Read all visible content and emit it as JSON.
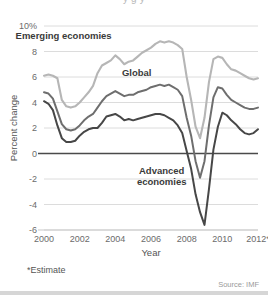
{
  "figure": {
    "title_partial": "y   g   y",
    "footnote": "*Estimate",
    "source": "Source: IMF"
  },
  "colors": {
    "emerging": "#b6b6b6",
    "global": "#6e6e6e",
    "advanced": "#474747",
    "grid": "#dcdcdc",
    "zero_line": "#4a4a4a",
    "text": "#555555"
  },
  "chart_data": {
    "type": "line",
    "title": "",
    "xlabel": "Year",
    "ylabel": "Percent change",
    "xlim": [
      2000,
      2012
    ],
    "ylim": [
      -6,
      10
    ],
    "ytick_labels": [
      "10%",
      "8",
      "6",
      "4",
      "2",
      "0",
      "-2",
      "-4",
      "-6"
    ],
    "yticks": [
      10,
      8,
      6,
      4,
      2,
      0,
      -2,
      -4,
      -6
    ],
    "xtick_labels": [
      "2000",
      "2002",
      "2004",
      "2006",
      "2008",
      "2010",
      "2012*"
    ],
    "xticks": [
      2000,
      2002,
      2004,
      2006,
      2008,
      2010,
      2012
    ],
    "grid": true,
    "legend_position": "inline-annotations",
    "x": [
      2000,
      2000.25,
      2000.5,
      2000.75,
      2001,
      2001.25,
      2001.5,
      2001.75,
      2002,
      2002.25,
      2002.5,
      2002.75,
      2003,
      2003.25,
      2003.5,
      2003.75,
      2004,
      2004.25,
      2004.5,
      2004.75,
      2005,
      2005.25,
      2005.5,
      2005.75,
      2006,
      2006.25,
      2006.5,
      2006.75,
      2007,
      2007.25,
      2007.5,
      2007.75,
      2008,
      2008.25,
      2008.5,
      2008.75,
      2009,
      2009.25,
      2009.5,
      2009.75,
      2010,
      2010.25,
      2010.5,
      2010.75,
      2011,
      2011.25,
      2011.5,
      2011.75,
      2012
    ],
    "series": [
      {
        "name": "Emerging economies",
        "color": "#b6b6b6",
        "values": [
          6.1,
          6.2,
          6.1,
          5.9,
          4.2,
          3.7,
          3.6,
          3.7,
          4.0,
          4.4,
          4.8,
          5.3,
          6.3,
          6.9,
          7.1,
          7.3,
          7.7,
          7.4,
          7.0,
          7.2,
          7.3,
          7.6,
          7.9,
          8.1,
          8.3,
          8.6,
          8.8,
          8.7,
          8.8,
          8.7,
          8.5,
          8.2,
          6.0,
          4.2,
          2.1,
          1.2,
          2.8,
          5.6,
          7.4,
          7.6,
          7.5,
          7.0,
          6.6,
          6.5,
          6.3,
          6.1,
          5.9,
          5.8,
          5.9
        ]
      },
      {
        "name": "Global",
        "color": "#6e6e6e",
        "values": [
          4.8,
          4.7,
          4.3,
          3.3,
          2.3,
          1.9,
          1.8,
          1.9,
          2.2,
          2.6,
          2.9,
          3.1,
          3.6,
          4.1,
          4.5,
          4.7,
          4.9,
          4.7,
          4.5,
          4.6,
          4.6,
          4.8,
          4.9,
          5.0,
          5.2,
          5.3,
          5.4,
          5.3,
          5.4,
          5.2,
          5.0,
          4.5,
          2.8,
          1.4,
          -0.6,
          -1.9,
          -0.6,
          2.2,
          4.4,
          5.2,
          5.1,
          4.6,
          4.2,
          4.0,
          3.8,
          3.6,
          3.5,
          3.5,
          3.6
        ]
      },
      {
        "name": "Advanced economies",
        "color": "#474747",
        "values": [
          4.1,
          3.9,
          3.4,
          2.2,
          1.2,
          0.9,
          0.9,
          1.0,
          1.4,
          1.7,
          1.9,
          2.0,
          2.0,
          2.4,
          2.9,
          3.0,
          3.1,
          2.9,
          2.6,
          2.7,
          2.6,
          2.7,
          2.8,
          2.9,
          3.0,
          3.1,
          3.1,
          3.0,
          2.8,
          2.6,
          2.2,
          1.6,
          0.2,
          -1.2,
          -3.2,
          -4.6,
          -5.6,
          -2.8,
          0.3,
          2.1,
          3.2,
          3.0,
          2.6,
          2.3,
          1.9,
          1.6,
          1.5,
          1.6,
          1.9
        ]
      }
    ],
    "annotations": [
      {
        "text": "Emerging economies",
        "x": 2001.1,
        "y": 9.0,
        "series": "Emerging economies"
      },
      {
        "text": "Global",
        "x": 2005.2,
        "y": 6.1,
        "series": "Global"
      },
      {
        "text": "Advanced",
        "x": 2006.6,
        "y": -1.6,
        "series": "Advanced economies"
      },
      {
        "text": "economies",
        "x": 2006.6,
        "y": -2.5,
        "series": "Advanced economies"
      }
    ]
  }
}
